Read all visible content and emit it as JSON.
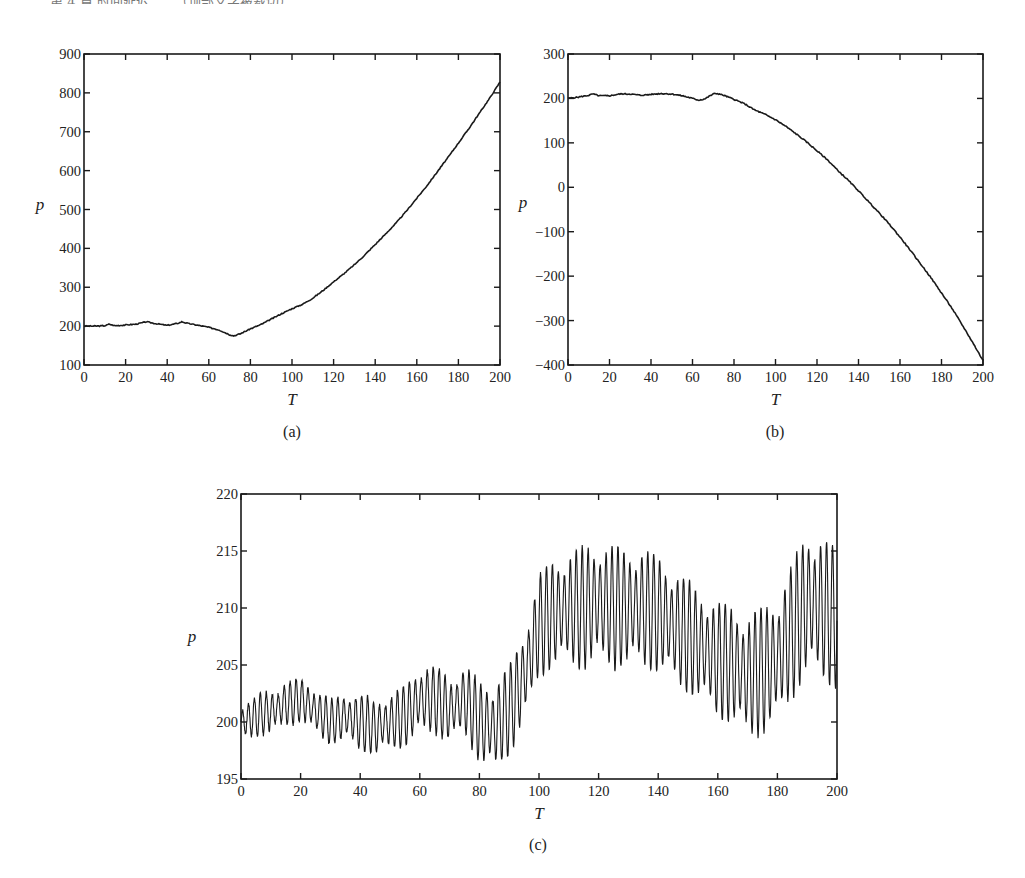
{
  "header_fragment": "第 4 章 时间延迟……（顶部文字被裁切）",
  "chart_data": [
    {
      "id": "a",
      "type": "line",
      "caption": "(a)",
      "title": "",
      "xlabel": "T",
      "ylabel": "p",
      "xlim": [
        0,
        200
      ],
      "ylim": [
        100,
        900
      ],
      "xticks": [
        0,
        20,
        40,
        60,
        80,
        100,
        120,
        140,
        160,
        180,
        200
      ],
      "yticks": [
        100,
        200,
        300,
        400,
        500,
        600,
        700,
        800,
        900
      ],
      "grid": false,
      "legend": null,
      "series": [
        {
          "name": "p",
          "x": [
            0,
            5,
            10,
            12,
            15,
            20,
            25,
            30,
            35,
            40,
            45,
            47,
            50,
            55,
            60,
            65,
            70,
            72,
            75,
            80,
            85,
            90,
            95,
            100,
            105,
            110,
            115,
            120,
            125,
            130,
            135,
            140,
            145,
            150,
            155,
            160,
            165,
            170,
            175,
            180,
            185,
            190,
            195,
            200
          ],
          "y": [
            200,
            200,
            201,
            205,
            201,
            203,
            205,
            211,
            206,
            202,
            207,
            211,
            207,
            202,
            197,
            190,
            178,
            175,
            180,
            193,
            204,
            218,
            232,
            245,
            256,
            272,
            292,
            314,
            335,
            358,
            383,
            410,
            437,
            465,
            496,
            529,
            562,
            598,
            634,
            671,
            708,
            747,
            786,
            828
          ]
        }
      ]
    },
    {
      "id": "b",
      "type": "line",
      "caption": "(b)",
      "title": "",
      "xlabel": "T",
      "ylabel": "p",
      "xlim": [
        0,
        200
      ],
      "ylim": [
        -400,
        300
      ],
      "xticks": [
        0,
        20,
        40,
        60,
        80,
        100,
        120,
        140,
        160,
        180,
        200
      ],
      "yticks": [
        -400,
        -300,
        -200,
        -100,
        0,
        100,
        200,
        300
      ],
      "grid": false,
      "legend": null,
      "series": [
        {
          "name": "p",
          "x": [
            0,
            5,
            10,
            12,
            15,
            20,
            25,
            30,
            35,
            40,
            45,
            50,
            55,
            60,
            63,
            66,
            70,
            72,
            75,
            80,
            85,
            90,
            95,
            100,
            105,
            110,
            115,
            120,
            125,
            130,
            135,
            140,
            145,
            150,
            155,
            160,
            165,
            170,
            175,
            180,
            185,
            190,
            195,
            200
          ],
          "y": [
            200,
            203,
            207,
            210,
            206,
            206,
            210,
            210,
            207,
            209,
            211,
            210,
            206,
            200,
            196,
            199,
            210,
            211,
            207,
            198,
            188,
            174,
            164,
            152,
            137,
            120,
            102,
            82,
            62,
            38,
            16,
            -8,
            -33,
            -58,
            -84,
            -112,
            -142,
            -173,
            -204,
            -238,
            -272,
            -310,
            -349,
            -390
          ]
        }
      ]
    },
    {
      "id": "c",
      "type": "line",
      "caption": "(c)",
      "title": "",
      "xlabel": "T",
      "ylabel": "p",
      "xlim": [
        0,
        200
      ],
      "ylim": [
        195,
        220
      ],
      "xticks": [
        0,
        20,
        40,
        60,
        80,
        100,
        120,
        140,
        160,
        180,
        200
      ],
      "yticks": [
        195,
        200,
        205,
        210,
        215,
        220
      ],
      "grid": false,
      "legend": null,
      "oscillation_period": 2,
      "series": [
        {
          "name": "p (envelope center / half-amplitude)",
          "x": [
            0,
            5,
            10,
            15,
            20,
            25,
            30,
            35,
            40,
            45,
            50,
            55,
            60,
            65,
            70,
            75,
            80,
            85,
            90,
            95,
            100,
            105,
            110,
            115,
            120,
            125,
            130,
            135,
            140,
            145,
            150,
            155,
            160,
            165,
            170,
            175,
            180,
            185,
            190,
            195,
            200
          ],
          "center": [
            200,
            200.5,
            201,
            201.5,
            202,
            201,
            200,
            200.5,
            200,
            199.5,
            200,
            200.5,
            202,
            202,
            201,
            202,
            200,
            199.5,
            201,
            204,
            208.5,
            209.5,
            210,
            210,
            210.5,
            210,
            210,
            210,
            209.5,
            208.5,
            207.5,
            206.5,
            205.5,
            205,
            204,
            204.5,
            205.5,
            208,
            210.5,
            210,
            209
          ],
          "amp": [
            1.5,
            1.8,
            2,
            2,
            2,
            2,
            2,
            2.2,
            2.5,
            2.5,
            2.5,
            2.7,
            3,
            3,
            3,
            3,
            3.7,
            4,
            4,
            4.3,
            4.5,
            5,
            5,
            5.5,
            5.5,
            5.5,
            5.3,
            5.3,
            5.2,
            5.2,
            5,
            5,
            5.2,
            5.3,
            5.5,
            5.7,
            5.7,
            6,
            6.5,
            6.5,
            6.3
          ]
        }
      ]
    }
  ],
  "labels": {
    "a": {
      "xlabel": "T",
      "ylabel": "p",
      "caption": "(a)"
    },
    "b": {
      "xlabel": "T",
      "ylabel": "p",
      "caption": "(b)"
    },
    "c": {
      "xlabel": "T",
      "ylabel": "p",
      "caption": "(c)"
    }
  }
}
